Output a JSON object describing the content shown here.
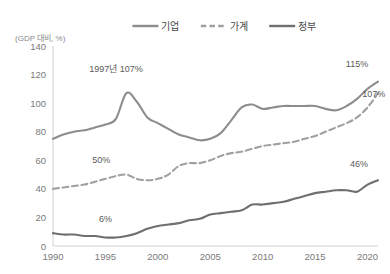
{
  "chart_data": {
    "type": "line",
    "title": "",
    "subtitle": "",
    "xlabel": "",
    "ylabel": "(GDP 대비, %)",
    "ylim": [
      0,
      140
    ],
    "xlim": [
      1990,
      2021
    ],
    "ytick_step": 20,
    "yticks": [
      "0",
      "20",
      "40",
      "60",
      "80",
      "100",
      "120",
      "140"
    ],
    "xticks": [
      "1990",
      "1995",
      "2000",
      "2005",
      "2010",
      "2015",
      "2020"
    ],
    "grid": false,
    "legend_position": "top-center",
    "x": [
      1990,
      1991,
      1992,
      1993,
      1994,
      1995,
      1996,
      1997,
      1998,
      1999,
      2000,
      2001,
      2002,
      2003,
      2004,
      2005,
      2006,
      2007,
      2008,
      2009,
      2010,
      2011,
      2012,
      2013,
      2014,
      2015,
      2016,
      2017,
      2018,
      2019,
      2020,
      2021
    ],
    "series": [
      {
        "name": "기업",
        "style": "solid",
        "color": "#8d8d8d",
        "values": [
          75,
          78,
          80,
          81,
          83,
          85,
          89,
          107,
          101,
          90,
          86,
          82,
          78,
          76,
          74,
          75,
          79,
          88,
          97,
          99,
          96,
          97,
          98,
          98,
          98,
          98,
          96,
          95,
          98,
          103,
          110,
          115
        ]
      },
      {
        "name": "가계",
        "style": "dashed",
        "color": "#a0a0a0",
        "values": [
          40,
          41,
          42,
          43,
          45,
          47,
          49,
          50,
          47,
          46,
          47,
          50,
          56,
          58,
          58,
          60,
          63,
          65,
          66,
          68,
          70,
          71,
          72,
          73,
          75,
          77,
          80,
          83,
          86,
          90,
          97,
          107
        ]
      },
      {
        "name": "정부",
        "style": "solid",
        "color": "#6f6f6f",
        "values": [
          9,
          8,
          8,
          7,
          7,
          6,
          6,
          7,
          9,
          12,
          14,
          15,
          16,
          18,
          19,
          22,
          23,
          24,
          25,
          29,
          29,
          30,
          31,
          33,
          35,
          37,
          38,
          39,
          39,
          38,
          43,
          46
        ]
      }
    ],
    "annotations": [
      {
        "id": "corp-peak",
        "text": "1997년 107%",
        "x": 1996.0,
        "y": 122
      },
      {
        "id": "household-mid",
        "text": "50%",
        "x": 1994.6,
        "y": 58
      },
      {
        "id": "gov-low",
        "text": "6%",
        "x": 1995.0,
        "y": 17
      },
      {
        "id": "corp-end",
        "text": "115%",
        "x": 2019.0,
        "y": 125
      },
      {
        "id": "household-end",
        "text": "107%",
        "x": 2020.6,
        "y": 104
      },
      {
        "id": "gov-end",
        "text": "46%",
        "x": 2019.2,
        "y": 55
      }
    ]
  },
  "legend": {
    "items": [
      {
        "label": "기업",
        "style": "solid",
        "color": "#8d8d8d"
      },
      {
        "label": "가계",
        "style": "dashed",
        "color": "#a0a0a0"
      },
      {
        "label": "정부",
        "style": "solid",
        "color": "#6f6f6f"
      }
    ]
  },
  "axis": {
    "unit_label": "(GDP 대비, %)"
  }
}
